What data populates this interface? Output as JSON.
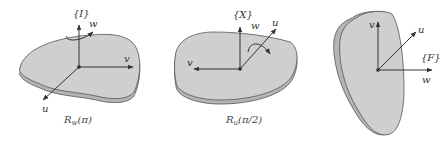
{
  "colors": {
    "plate_fill": "#cfcfcf",
    "plate_edge": "#b4b4b4",
    "outline": "#555555",
    "axis": "#333333"
  },
  "panels": [
    {
      "frame_label": "{I}",
      "axes": {
        "w": "w",
        "v": "v",
        "u": "u"
      },
      "caption_main": "R",
      "caption_sub": "w",
      "caption_arg": "(π)"
    },
    {
      "frame_label": "{X}",
      "axes": {
        "w": "w",
        "u": "u",
        "v": "v"
      },
      "caption_main": "R",
      "caption_sub": "u",
      "caption_arg": "(π/2)"
    },
    {
      "frame_label": "{F}",
      "axes": {
        "v": "v",
        "u": "u",
        "w": "w"
      }
    }
  ]
}
